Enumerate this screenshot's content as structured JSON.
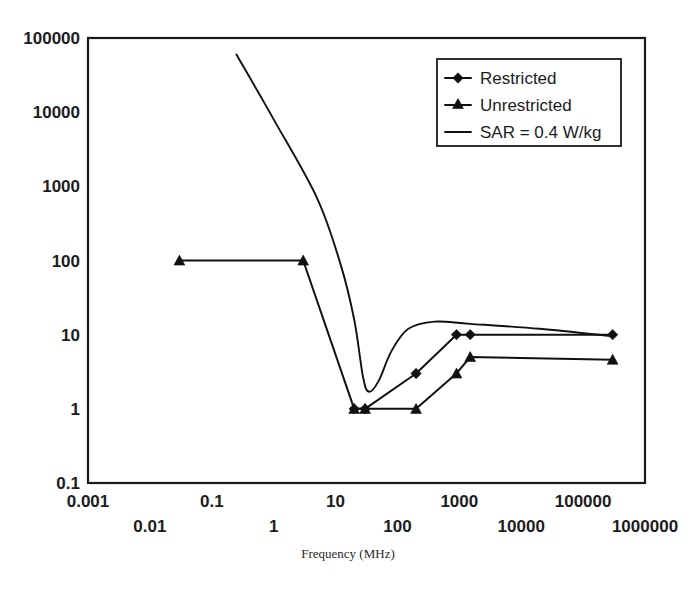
{
  "chart_data": {
    "type": "line",
    "title": "",
    "subtitle": "",
    "xlabel": "Frequency (MHz)",
    "ylabel": "",
    "xscale": "log",
    "yscale": "log",
    "xlim": [
      0.001,
      1000000
    ],
    "ylim": [
      0.1,
      100000
    ],
    "grid": false,
    "legend_position": "top-right",
    "x_tick_labels_row1": [
      "0.001",
      "0.1",
      "10",
      "1000",
      "100000"
    ],
    "x_tick_labels_row2": [
      "0.01",
      "1",
      "100",
      "10000",
      "1000000"
    ],
    "x_tick_values_row1": [
      0.001,
      0.1,
      10,
      1000,
      100000
    ],
    "x_tick_values_row2": [
      0.01,
      1,
      100,
      10000,
      1000000
    ],
    "y_tick_labels": [
      "100000",
      "10000",
      "1000",
      "100",
      "10",
      "1",
      "0.1"
    ],
    "y_tick_values": [
      100000,
      10000,
      1000,
      100,
      10,
      1,
      0.1
    ],
    "series": [
      {
        "name": "Restricted",
        "marker": "diamond",
        "points": [
          {
            "x": 20,
            "y": 1
          },
          {
            "x": 30,
            "y": 1
          },
          {
            "x": 200,
            "y": 3
          },
          {
            "x": 900,
            "y": 10
          },
          {
            "x": 1500,
            "y": 10
          },
          {
            "x": 300000,
            "y": 10
          }
        ]
      },
      {
        "name": "Unrestricted",
        "marker": "triangle",
        "points": [
          {
            "x": 0.03,
            "y": 100
          },
          {
            "x": 3,
            "y": 100
          },
          {
            "x": 20,
            "y": 1
          },
          {
            "x": 30,
            "y": 1
          },
          {
            "x": 200,
            "y": 1
          },
          {
            "x": 900,
            "y": 3
          },
          {
            "x": 1500,
            "y": 5
          },
          {
            "x": 300000,
            "y": 4.6
          }
        ]
      },
      {
        "name": "SAR = 0.4 W/kg",
        "marker": "none",
        "points": [
          {
            "x": 0.25,
            "y": 60000
          },
          {
            "x": 1,
            "y": 8000
          },
          {
            "x": 5,
            "y": 700
          },
          {
            "x": 12,
            "y": 90
          },
          {
            "x": 20,
            "y": 16
          },
          {
            "x": 28,
            "y": 2.6
          },
          {
            "x": 35,
            "y": 1.7
          },
          {
            "x": 50,
            "y": 2.4
          },
          {
            "x": 80,
            "y": 6
          },
          {
            "x": 150,
            "y": 12
          },
          {
            "x": 400,
            "y": 15
          },
          {
            "x": 1500,
            "y": 14
          },
          {
            "x": 20000,
            "y": 12
          },
          {
            "x": 300000,
            "y": 9.5
          }
        ]
      }
    ]
  },
  "legend": {
    "entries": [
      {
        "label": "Restricted",
        "marker": "diamond"
      },
      {
        "label": "Unrestricted",
        "marker": "triangle"
      },
      {
        "label": "SAR = 0.4 W/kg",
        "marker": "line"
      }
    ]
  }
}
